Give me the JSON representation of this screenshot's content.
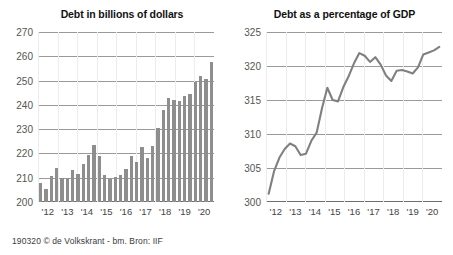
{
  "caption": "190320 © de Volkskrant - bm. Bron: IIF",
  "colors": {
    "bar": "#8e8e8e",
    "line": "#808080",
    "gridline": "#9a9a9a",
    "axis": "#6e6e6e",
    "title_text": "#111111",
    "tick_text": "#555555",
    "background": "#ffffff"
  },
  "chart_data": [
    {
      "type": "bar",
      "title": "Debt in billions of dollars",
      "xlabel": "",
      "ylabel": "",
      "ylim": [
        200,
        270
      ],
      "yticks": [
        200,
        210,
        220,
        230,
        240,
        250,
        260,
        270
      ],
      "xtick_labels": [
        "'12",
        "'13",
        "'14",
        "'15",
        "'16",
        "'17",
        "'18",
        "'19",
        "'20"
      ],
      "grid": true,
      "legend": "none",
      "categories": [
        "2012Q1",
        "2012Q2",
        "2012Q3",
        "2012Q4",
        "2013Q1",
        "2013Q2",
        "2013Q3",
        "2013Q4",
        "2014Q1",
        "2014Q2",
        "2014Q3",
        "2014Q4",
        "2015Q1",
        "2015Q2",
        "2015Q3",
        "2015Q4",
        "2016Q1",
        "2016Q2",
        "2016Q3",
        "2016Q4",
        "2017Q1",
        "2017Q2",
        "2017Q3",
        "2017Q4",
        "2018Q1",
        "2018Q2",
        "2018Q3",
        "2018Q4",
        "2019Q1",
        "2019Q2",
        "2019Q3",
        "2019Q4",
        "2020Q1"
      ],
      "values": [
        207.8,
        205.5,
        210.8,
        214.0,
        209.7,
        210.0,
        213.2,
        211.5,
        215.8,
        219.5,
        223.5,
        219.0,
        211.0,
        209.5,
        210.5,
        211.2,
        213.5,
        219.0,
        216.5,
        222.5,
        218.0,
        223.0,
        230.5,
        237.8,
        243.0,
        242.0,
        241.5,
        243.5,
        244.5,
        249.5,
        252.0,
        250.5,
        257.8
      ]
    },
    {
      "type": "line",
      "title": "Debt as a percentage of GDP",
      "xlabel": "",
      "ylabel": "",
      "ylim": [
        300,
        325
      ],
      "yticks": [
        300,
        305,
        310,
        315,
        320,
        325
      ],
      "xtick_labels": [
        "'12",
        "'13",
        "'14",
        "'15",
        "'16",
        "'17",
        "'18",
        "'19",
        "'20"
      ],
      "grid": true,
      "legend": "none",
      "x": [
        "2012Q1",
        "2012Q2",
        "2012Q3",
        "2012Q4",
        "2013Q1",
        "2013Q2",
        "2013Q3",
        "2013Q4",
        "2014Q1",
        "2014Q2",
        "2014Q3",
        "2014Q4",
        "2015Q1",
        "2015Q2",
        "2015Q3",
        "2015Q4",
        "2016Q1",
        "2016Q2",
        "2016Q3",
        "2016Q4",
        "2017Q1",
        "2017Q2",
        "2017Q3",
        "2017Q4",
        "2018Q1",
        "2018Q2",
        "2018Q3",
        "2018Q4",
        "2019Q1",
        "2019Q2",
        "2019Q3",
        "2019Q4",
        "2020Q1"
      ],
      "values": [
        301.2,
        304.5,
        306.5,
        307.8,
        308.6,
        308.2,
        306.9,
        307.1,
        309.0,
        310.2,
        313.8,
        316.8,
        315.0,
        314.8,
        316.9,
        318.5,
        320.4,
        321.9,
        321.5,
        320.6,
        321.3,
        320.2,
        318.6,
        317.8,
        319.3,
        319.4,
        319.2,
        318.9,
        319.8,
        321.7,
        322.0,
        322.3,
        322.8
      ]
    }
  ]
}
